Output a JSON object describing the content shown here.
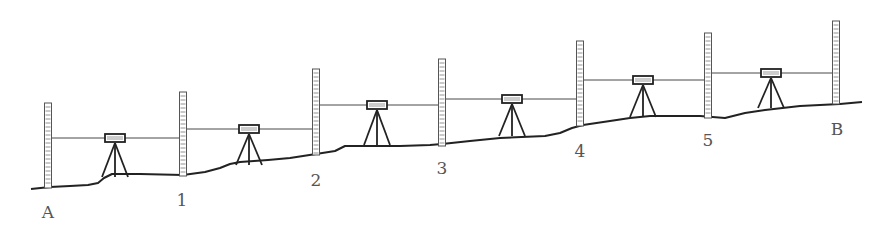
{
  "diagram": {
    "type": "leveling-survey-cross-section",
    "colors": {
      "line": "#222222",
      "staff": "#555555",
      "label": "#555555",
      "background": "#ffffff"
    },
    "points": [
      {
        "label": "A",
        "x": 48,
        "staff_top": 103,
        "ground": 188,
        "label_x": 48,
        "label_y": 218
      },
      {
        "label": "1",
        "x": 183,
        "staff_top": 92,
        "ground": 176,
        "label_x": 182,
        "label_y": 206
      },
      {
        "label": "2",
        "x": 316,
        "staff_top": 69,
        "ground": 155,
        "label_x": 316,
        "label_y": 186
      },
      {
        "label": "3",
        "x": 442,
        "staff_top": 59,
        "ground": 146,
        "label_x": 442,
        "label_y": 174
      },
      {
        "label": "4",
        "x": 580,
        "staff_top": 41,
        "ground": 126,
        "label_x": 580,
        "label_y": 157
      },
      {
        "label": "5",
        "x": 708,
        "staff_top": 33,
        "ground": 118,
        "label_x": 708,
        "label_y": 146
      },
      {
        "label": "B",
        "x": 836,
        "staff_top": 21,
        "ground": 104,
        "label_x": 837,
        "label_y": 135
      }
    ],
    "instruments": [
      {
        "x": 115,
        "sight_y": 138,
        "foot_y": 177
      },
      {
        "x": 249,
        "sight_y": 129,
        "foot_y": 165
      },
      {
        "x": 377,
        "sight_y": 105,
        "foot_y": 145
      },
      {
        "x": 512,
        "sight_y": 99,
        "foot_y": 136
      },
      {
        "x": 643,
        "sight_y": 80,
        "foot_y": 117
      },
      {
        "x": 771,
        "sight_y": 73,
        "foot_y": 108
      }
    ],
    "ground_profile": "M31,189 L50,187 L70,186 L88,185 L98,183 L104,178 L112,174 L140,174 L183,175 L205,172 L220,168 L230,164 L240,162 L268,160 L290,158 L316,154 L335,151 L345,146 L378,146 L400,146 L430,145 L442,144 L470,141 L500,138 L545,136 L560,133 L572,128 L583,125 L610,121 L630,118 L650,116 L700,116 L725,118 L745,113 L765,110 L800,106 L840,104 L862,102"
  }
}
